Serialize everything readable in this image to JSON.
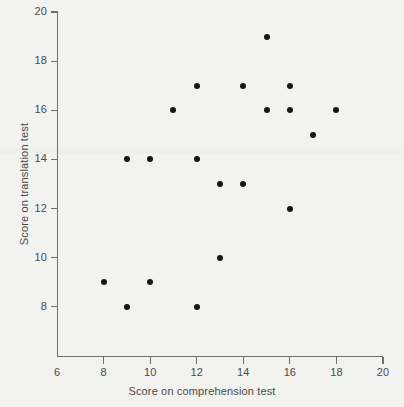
{
  "chart_data": {
    "type": "scatter",
    "title": "",
    "xlabel": "Score on comprehension test",
    "ylabel": "Score on translation test",
    "xlim": [
      6,
      20
    ],
    "ylim": [
      6,
      20
    ],
    "xticks": [
      6,
      8,
      10,
      12,
      14,
      16,
      18,
      20
    ],
    "yticks": [
      8,
      10,
      12,
      14,
      16,
      18,
      20
    ],
    "grid": false,
    "legend": null,
    "marker": {
      "shape": "circle",
      "color": "#161616",
      "size_px": 6
    },
    "points": [
      {
        "x": 8,
        "y": 9
      },
      {
        "x": 9,
        "y": 8
      },
      {
        "x": 9,
        "y": 14
      },
      {
        "x": 10,
        "y": 9
      },
      {
        "x": 10,
        "y": 14
      },
      {
        "x": 11,
        "y": 16
      },
      {
        "x": 12,
        "y": 8
      },
      {
        "x": 12,
        "y": 14
      },
      {
        "x": 12,
        "y": 17
      },
      {
        "x": 13,
        "y": 10
      },
      {
        "x": 13,
        "y": 13
      },
      {
        "x": 14,
        "y": 13
      },
      {
        "x": 14,
        "y": 17
      },
      {
        "x": 15,
        "y": 16
      },
      {
        "x": 15,
        "y": 19
      },
      {
        "x": 16,
        "y": 12
      },
      {
        "x": 16,
        "y": 16
      },
      {
        "x": 16,
        "y": 17
      },
      {
        "x": 17,
        "y": 15
      },
      {
        "x": 18,
        "y": 16
      }
    ]
  },
  "colors": {
    "background": "#f2f2f0",
    "axis": "#6e6e6e",
    "text": "#4a4a4a",
    "marker": "#161616"
  }
}
